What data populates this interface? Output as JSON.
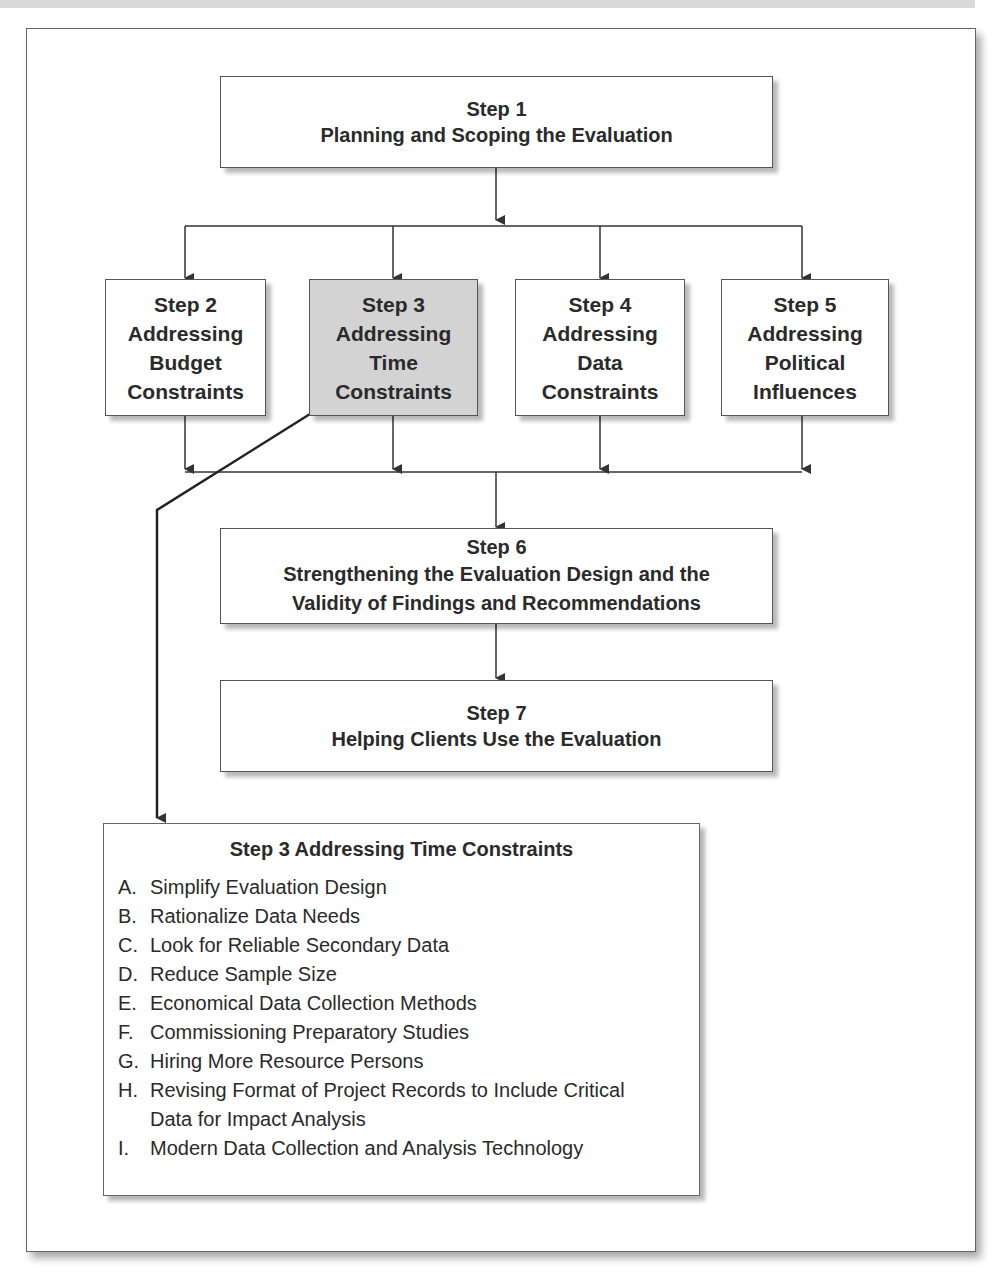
{
  "diagram": {
    "step1": {
      "title": "Step 1",
      "subtitle": "Planning and Scoping the Evaluation"
    },
    "middle_steps": [
      {
        "title": "Step 2",
        "subtitle": "Addressing\nBudget\nConstraints",
        "highlighted": false
      },
      {
        "title": "Step 3",
        "subtitle": "Addressing\nTime\nConstraints",
        "highlighted": true
      },
      {
        "title": "Step 4",
        "subtitle": "Addressing\nData\nConstraints",
        "highlighted": false
      },
      {
        "title": "Step 5",
        "subtitle": "Addressing\nPolitical\nInfluences",
        "highlighted": false
      }
    ],
    "step6": {
      "title": "Step 6",
      "subtitle": "Strengthening the Evaluation Design and the\nValidity of Findings and Recommendations"
    },
    "step7": {
      "title": "Step 7",
      "subtitle": "Helping Clients Use the Evaluation"
    },
    "detail": {
      "heading": "Step 3  Addressing Time Constraints",
      "items": [
        {
          "letter": "A.",
          "text": "Simplify Evaluation Design"
        },
        {
          "letter": "B.",
          "text": "Rationalize Data Needs"
        },
        {
          "letter": "C.",
          "text": "Look for Reliable Secondary Data"
        },
        {
          "letter": "D.",
          "text": "Reduce Sample Size"
        },
        {
          "letter": "E.",
          "text": "Economical Data Collection Methods"
        },
        {
          "letter": "F.",
          "text": "Commissioning Preparatory Studies"
        },
        {
          "letter": "G.",
          "text": "Hiring More Resource Persons"
        },
        {
          "letter": "H.",
          "text": "Revising Format of Project Records to Include Critical Data for Impact Analysis"
        },
        {
          "letter": "I.",
          "text": "Modern Data Collection and Analysis Technology"
        }
      ]
    },
    "colors": {
      "highlight": "#d3d3d3",
      "line": "#333333"
    }
  }
}
